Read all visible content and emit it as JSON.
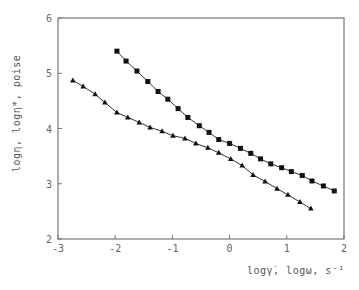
{
  "chart_data": {
    "type": "line",
    "title": "",
    "xlabel": "logγ̇, logω,  s⁻¹",
    "ylabel": "logη, logη*,  poise",
    "xlim": [
      -3,
      2
    ],
    "ylim": [
      2,
      6
    ],
    "xticks": [
      -3,
      -2,
      -1,
      0,
      1,
      2
    ],
    "yticks": [
      2,
      3,
      4,
      5,
      6
    ],
    "grid": false,
    "legend": null,
    "series": [
      {
        "name": "squares",
        "marker": "square",
        "x": [
          -1.97,
          -1.81,
          -1.62,
          -1.43,
          -1.25,
          -1.08,
          -0.9,
          -0.73,
          -0.53,
          -0.36,
          -0.19,
          0.0,
          0.19,
          0.37,
          0.54,
          0.72,
          0.91,
          1.08,
          1.27,
          1.44,
          1.64,
          1.83
        ],
        "y": [
          5.4,
          5.22,
          5.04,
          4.85,
          4.67,
          4.53,
          4.36,
          4.2,
          4.05,
          3.93,
          3.8,
          3.73,
          3.64,
          3.55,
          3.45,
          3.36,
          3.29,
          3.22,
          3.15,
          3.05,
          2.96,
          2.87
        ]
      },
      {
        "name": "triangles",
        "marker": "triangle",
        "x": [
          -2.74,
          -2.56,
          -2.35,
          -2.18,
          -1.97,
          -1.78,
          -1.58,
          -1.39,
          -1.18,
          -0.99,
          -0.78,
          -0.59,
          -0.38,
          -0.19,
          0.02,
          0.22,
          0.41,
          0.62,
          0.83,
          1.02,
          1.23,
          1.42
        ],
        "y": [
          4.87,
          4.76,
          4.62,
          4.47,
          4.29,
          4.2,
          4.11,
          4.02,
          3.95,
          3.87,
          3.82,
          3.73,
          3.65,
          3.56,
          3.45,
          3.33,
          3.16,
          3.04,
          2.91,
          2.8,
          2.67,
          2.55
        ]
      }
    ]
  },
  "axes": {
    "x_tick_labels": [
      "-3",
      "-2",
      "-1",
      "0",
      "1",
      "2"
    ],
    "y_tick_labels": [
      "2",
      "3",
      "4",
      "5",
      "6"
    ],
    "x_label": "logγ̇, logω,  s⁻¹",
    "y_label": "logη, logη*,  poise"
  },
  "colors": {
    "line": "#333333",
    "marker": "#111111",
    "frame": "#777777",
    "text": "#666666"
  }
}
